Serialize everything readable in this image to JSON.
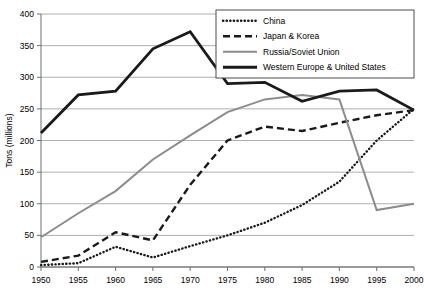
{
  "chart_data": {
    "type": "line",
    "title": "",
    "xlabel": "",
    "ylabel": "Tons (millions)",
    "xlim": [
      1950,
      2000
    ],
    "ylim": [
      0,
      400
    ],
    "ytick_step": 50,
    "xtick_step": 5,
    "grid": "horizontal",
    "legend_position": "top-right",
    "x": [
      1950,
      1955,
      1960,
      1965,
      1970,
      1975,
      1980,
      1985,
      1990,
      1995,
      2000
    ],
    "xticklabels": [
      "1950",
      "1955",
      "1960",
      "1965",
      "1970",
      "1975",
      "1980",
      "1985",
      "1990",
      "1995",
      "2000"
    ],
    "yticklabels": [
      "0",
      "50",
      "100",
      "150",
      "200",
      "250",
      "300",
      "350",
      "400"
    ],
    "series": [
      {
        "name": "China",
        "style": "dotted",
        "color": "#1a1a1a",
        "values": [
          3,
          6,
          32,
          15,
          33,
          50,
          70,
          98,
          135,
          200,
          250
        ]
      },
      {
        "name": "Japan & Korea",
        "style": "dashed",
        "color": "#1a1a1a",
        "values": [
          8,
          18,
          55,
          42,
          130,
          200,
          222,
          215,
          228,
          240,
          248
        ]
      },
      {
        "name": "Russia/Soviet Union",
        "style": "solid",
        "color": "#8c8c8c",
        "values": [
          47,
          85,
          120,
          170,
          208,
          245,
          265,
          272,
          265,
          90,
          100
        ]
      },
      {
        "name": "Western Europe & United States",
        "style": "solid-bold",
        "color": "#1a1a1a",
        "values": [
          212,
          272,
          278,
          345,
          372,
          290,
          292,
          262,
          278,
          280,
          248
        ]
      }
    ]
  },
  "legend": {
    "items": [
      {
        "label": "China",
        "swatch": "dotted-line-swatch"
      },
      {
        "label": "Japan & Korea",
        "swatch": "dashed-line-swatch"
      },
      {
        "label": "Russia/Soviet Union",
        "swatch": "gray-line-swatch"
      },
      {
        "label": "Western Europe & United States",
        "swatch": "bold-line-swatch"
      }
    ]
  }
}
